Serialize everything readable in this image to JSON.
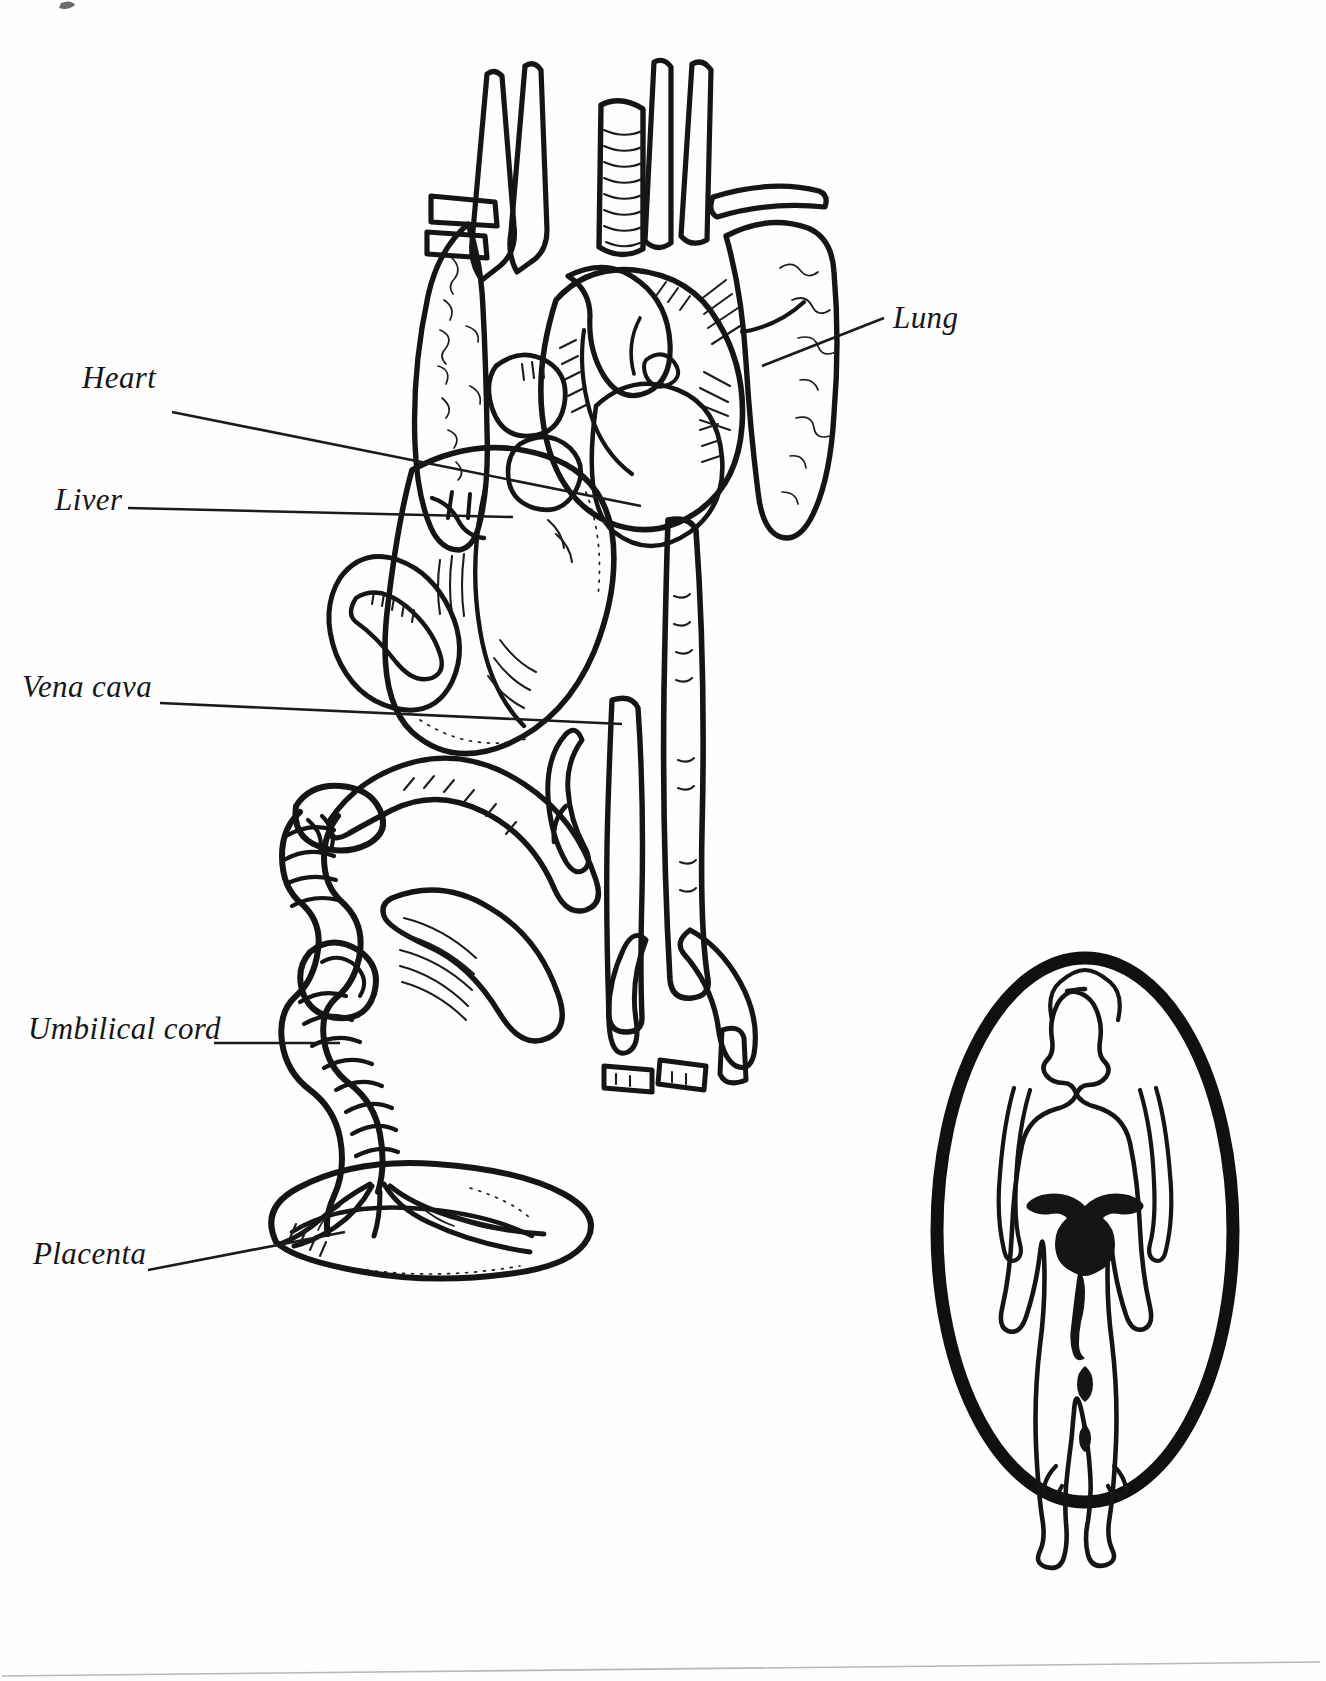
{
  "figure": {
    "style": "black-and-white pen-and-ink line art",
    "ink_color": "#151515",
    "background_color": "#ffffff"
  },
  "labels": [
    {
      "id": "lung",
      "text": "Lung",
      "x": 893,
      "y": 302,
      "align": "left",
      "leader": {
        "x1": 884,
        "y1": 318,
        "x2": 762,
        "y2": 366
      }
    },
    {
      "id": "heart",
      "text": "Heart",
      "x": 82,
      "y": 362,
      "align": "right",
      "leader": {
        "x1": 172,
        "y1": 412,
        "x2": 641,
        "y2": 506
      }
    },
    {
      "id": "liver",
      "text": "Liver",
      "x": 55,
      "y": 484,
      "align": "right",
      "leader": {
        "x1": 128,
        "y1": 508,
        "x2": 513,
        "y2": 517
      }
    },
    {
      "id": "vena-cava",
      "text": "Vena cava",
      "x": 22,
      "y": 671,
      "align": "right",
      "leader": {
        "x1": 160,
        "y1": 703,
        "x2": 622,
        "y2": 724
      }
    },
    {
      "id": "umbilical-cord",
      "text": "Umbilical cord",
      "x": 28,
      "y": 1013,
      "align": "right",
      "leader": {
        "x1": 214,
        "y1": 1043,
        "x2": 340,
        "y2": 1043
      }
    },
    {
      "id": "placenta",
      "text": "Placenta",
      "x": 33,
      "y": 1238,
      "align": "right",
      "leader": {
        "x1": 148,
        "y1": 1270,
        "x2": 345,
        "y2": 1232
      }
    }
  ],
  "inset": {
    "id": "female-figure-inset",
    "shape": "oval",
    "center_x": 1085,
    "center_y": 1230,
    "radius_x": 148,
    "radius_y": 272,
    "ring_thickness": 13,
    "contents": "female body silhouette with uterus and vagina outline"
  },
  "organs": [
    {
      "id": "lung",
      "name": "Lung"
    },
    {
      "id": "heart",
      "name": "Heart"
    },
    {
      "id": "liver",
      "name": "Liver"
    },
    {
      "id": "vena-cava",
      "name": "Vena cava"
    },
    {
      "id": "umbilical-cord",
      "name": "Umbilical cord"
    },
    {
      "id": "placenta",
      "name": "Placenta"
    },
    {
      "id": "trachea",
      "name": "Trachea"
    },
    {
      "id": "aorta",
      "name": "Aorta"
    }
  ]
}
